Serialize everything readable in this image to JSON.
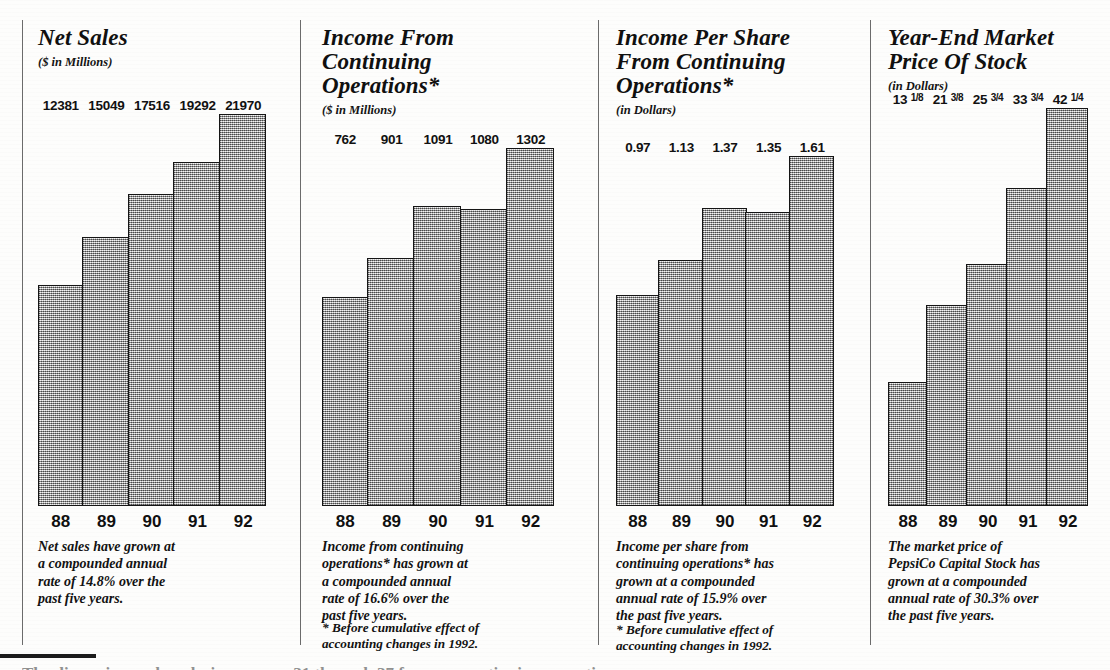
{
  "page": {
    "background_color": "#fdfdfc",
    "ink_color": "#121212",
    "bar_fill_color": "#c9c9c9",
    "bar_border_color": "#151515",
    "divider_color": "#6b6b6b",
    "bottom_cut_text": "The discussion and analysis on pages 31 through 37 focus on continuing operations."
  },
  "charts": [
    {
      "id": "net-sales",
      "title": "Net Sales",
      "subtitle": "($ in Millions)",
      "caption": "Net sales have grown at\na compounded annual\nrate of 14.8% over the\npast five years.",
      "footnote": "",
      "categories": [
        "88",
        "89",
        "90",
        "91",
        "92"
      ],
      "value_labels": [
        "12381",
        "15049",
        "17516",
        "19292",
        "21970"
      ]
    },
    {
      "id": "income-from-continuing-operations",
      "title": "Income From\nContinuing\nOperations*",
      "subtitle": "($ in Millions)",
      "caption": "Income from continuing\noperations* has grown at\na compounded annual\nrate of 16.6% over the\npast five years.",
      "footnote": "* Before cumulative effect of\naccounting changes in 1992.",
      "categories": [
        "88",
        "89",
        "90",
        "91",
        "92"
      ],
      "value_labels": [
        "762",
        "901",
        "1091",
        "1080",
        "1302"
      ]
    },
    {
      "id": "income-per-share-from-continuing-operations",
      "title": "Income Per Share\nFrom Continuing\nOperations*",
      "subtitle": "(in Dollars)",
      "caption": "Income per share from\ncontinuing operations* has\ngrown at a compounded\nannual rate of 15.9% over\nthe past five years.",
      "footnote": "* Before cumulative effect of\naccounting changes in 1992.",
      "categories": [
        "88",
        "89",
        "90",
        "91",
        "92"
      ],
      "value_labels": [
        "0.97",
        "1.13",
        "1.37",
        "1.35",
        "1.61"
      ]
    },
    {
      "id": "year-end-market-price-of-stock",
      "title": "Year-End Market\nPrice Of Stock",
      "subtitle": "(in Dollars)",
      "caption": "The market price of\nPepsiCo Capital Stock has\ngrown at a compounded\nannual rate of 30.3% over\nthe past five years.",
      "footnote": "",
      "categories": [
        "88",
        "89",
        "90",
        "91",
        "92"
      ],
      "value_labels": [
        "13 1/8",
        "21 3/8",
        "25 3/4",
        "33 3/4",
        "42 1/4"
      ]
    }
  ],
  "chart_data": [
    {
      "type": "bar",
      "title": "Net Sales",
      "subtitle": "($ in Millions)",
      "xlabel": "",
      "ylabel": "$ in Millions",
      "categories": [
        "88",
        "89",
        "90",
        "91",
        "92"
      ],
      "values": [
        12381,
        15049,
        17516,
        19292,
        21970
      ],
      "ylim": [
        0,
        21970
      ],
      "grid": false,
      "legend": "none",
      "annotations": [
        "Net sales have grown at a compounded annual rate of 14.8% over the past five years."
      ]
    },
    {
      "type": "bar",
      "title": "Income From Continuing Operations*",
      "subtitle": "($ in Millions)",
      "xlabel": "",
      "ylabel": "$ in Millions",
      "categories": [
        "88",
        "89",
        "90",
        "91",
        "92"
      ],
      "values": [
        762,
        901,
        1091,
        1080,
        1302
      ],
      "ylim": [
        0,
        1302
      ],
      "grid": false,
      "legend": "none",
      "annotations": [
        "Income from continuing operations* has grown at a compounded annual rate of 16.6% over the past five years.",
        "* Before cumulative effect of accounting changes in 1992."
      ]
    },
    {
      "type": "bar",
      "title": "Income Per Share From Continuing Operations*",
      "subtitle": "(in Dollars)",
      "xlabel": "",
      "ylabel": "Dollars",
      "categories": [
        "88",
        "89",
        "90",
        "91",
        "92"
      ],
      "values": [
        0.97,
        1.13,
        1.37,
        1.35,
        1.61
      ],
      "ylim": [
        0,
        1.61
      ],
      "grid": false,
      "legend": "none",
      "annotations": [
        "Income per share from continuing operations* has grown at a compounded annual rate of 15.9% over the past five years.",
        "* Before cumulative effect of accounting changes in 1992."
      ]
    },
    {
      "type": "bar",
      "title": "Year-End Market Price Of Stock",
      "subtitle": "(in Dollars)",
      "xlabel": "",
      "ylabel": "Dollars",
      "categories": [
        "88",
        "89",
        "90",
        "91",
        "92"
      ],
      "values": [
        13.125,
        21.375,
        25.75,
        33.75,
        42.25
      ],
      "ylim": [
        0,
        42.25
      ],
      "grid": false,
      "legend": "none",
      "annotations": [
        "The market price of PepsiCo Capital Stock has grown at a compounded annual rate of 30.3% over the past five years."
      ]
    }
  ]
}
